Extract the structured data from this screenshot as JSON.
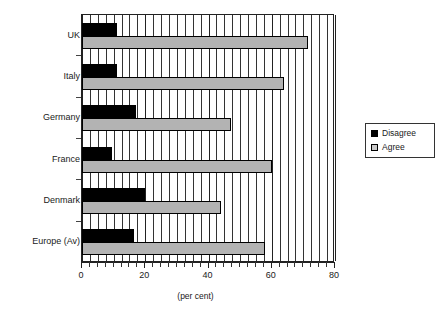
{
  "chart_data": {
    "type": "bar",
    "orientation": "horizontal",
    "title": "",
    "xlabel": "(per cent)",
    "ylabel": "",
    "xlim": [
      0,
      80
    ],
    "xticks": [
      0,
      20,
      40,
      60,
      80
    ],
    "xtick_labels": [
      "0",
      "20",
      "40",
      "60",
      "80"
    ],
    "minor_gridline_step": 2.5,
    "grid": true,
    "legend_position": "right",
    "categories": [
      "UK",
      "Italy",
      "Germany",
      "France",
      "Denmark",
      "Europe (Av)"
    ],
    "series": [
      {
        "name": "Disagree",
        "color": "#000000",
        "values": [
          11,
          11,
          17,
          9.5,
          20,
          16.5
        ]
      },
      {
        "name": "Agree",
        "color": "#b3b3b3",
        "values": [
          71.5,
          64,
          47,
          60,
          44,
          58
        ]
      }
    ]
  },
  "axis": {
    "x_title": "(per cent)"
  },
  "legend": {
    "entries": [
      {
        "label": "Disagree"
      },
      {
        "label": "Agree"
      }
    ]
  }
}
